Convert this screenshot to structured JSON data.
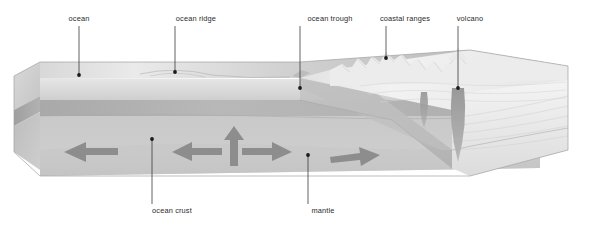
{
  "figure": {
    "background_color": "#ffffff",
    "label_color": "#2b2b2b",
    "leader_color": "#3a3a3a"
  },
  "labels": {
    "top": [
      {
        "id": "ocean",
        "text": "ocean",
        "text_x": 79,
        "text_y": 21,
        "anchor": "middle",
        "line_x": 79,
        "line_y1": 26,
        "line_y2": 75,
        "dot_x": 79,
        "dot_y": 75
      },
      {
        "id": "ocean-ridge",
        "text": "ocean ridge",
        "text_x": 196,
        "text_y": 21,
        "anchor": "middle",
        "line_x": 175,
        "line_y1": 26,
        "line_y2": 72,
        "dot_x": 175,
        "dot_y": 72
      },
      {
        "id": "ocean-trough",
        "text": "ocean trough",
        "text_x": 330,
        "text_y": 21,
        "anchor": "middle",
        "line_x": 300,
        "line_y1": 26,
        "line_y2": 88,
        "dot_x": 300,
        "dot_y": 88
      },
      {
        "id": "coastal-ranges",
        "text": "coastal ranges",
        "text_x": 405,
        "text_y": 21,
        "anchor": "middle",
        "line_x": 386,
        "line_y1": 26,
        "line_y2": 58,
        "dot_x": 386,
        "dot_y": 58
      },
      {
        "id": "volcano",
        "text": "volcano",
        "text_x": 470,
        "text_y": 21,
        "anchor": "middle",
        "line_x": 458,
        "line_y1": 26,
        "line_y2": 88,
        "dot_x": 458,
        "dot_y": 88
      }
    ],
    "bottom": [
      {
        "id": "ocean-crust",
        "text": "ocean crust",
        "text_x": 172,
        "text_y": 213,
        "anchor": "middle",
        "line_x": 152,
        "line_y1": 139,
        "line_y2": 204,
        "dot_x": 152,
        "dot_y": 139
      },
      {
        "id": "mantle",
        "text": "mantle",
        "text_x": 323,
        "text_y": 213,
        "anchor": "middle",
        "line_x": 308,
        "line_y1": 155,
        "line_y2": 204,
        "dot_x": 308,
        "dot_y": 155
      }
    ]
  },
  "colors": {
    "ocean_surface_light": "#e4e4e4",
    "ocean_surface_mid": "#cfcfcf",
    "ocean_surface_dark": "#b6b6b6",
    "front_water_band": "#dcdcdc",
    "front_crust_band": "#b4b4b4",
    "front_mantle_band": "#c8c8c8",
    "side_face": "#c0c0c0",
    "continent_light": "#f0f0f0",
    "continent_mid": "#dedede",
    "slab": "#b8b8b8",
    "magma": "#9a9a9a",
    "arrow_fill": "#8d8d8d",
    "outline": "#9d9d9d"
  },
  "arrows": [
    {
      "id": "arrow-spreading-left-far",
      "direction": "left",
      "x": 60,
      "y": 152,
      "length": 52,
      "note": "oceanic plate moving left"
    },
    {
      "id": "arrow-spreading-left-ridge",
      "direction": "left",
      "x": 170,
      "y": 150,
      "length": 42,
      "note": "divergence away from ridge, left"
    },
    {
      "id": "arrow-upwelling",
      "direction": "up",
      "x": 236,
      "y": 136,
      "length": 38,
      "note": "mantle upwelling beneath ridge"
    },
    {
      "id": "arrow-spreading-right-ridge",
      "direction": "right",
      "x": 246,
      "y": 150,
      "length": 46,
      "note": "divergence away from ridge, right"
    },
    {
      "id": "arrow-convergence-right",
      "direction": "right",
      "x": 330,
      "y": 156,
      "length": 48,
      "note": "plate motion toward trench"
    }
  ],
  "features": {
    "ridge_x": 175,
    "trough_x": 300,
    "volcano_x": 458,
    "slab_dip_note": "oceanic slab descends to the right beneath continental margin",
    "magma_conduits": [
      {
        "id": "magma-conduit-left",
        "x": 424,
        "y_top": 92,
        "y_bottom": 128
      },
      {
        "id": "magma-conduit-volcano",
        "x": 458,
        "y_top": 90,
        "y_bottom": 160
      }
    ]
  }
}
